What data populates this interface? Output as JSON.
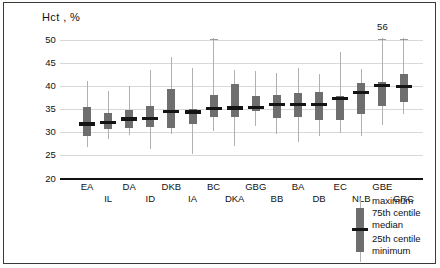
{
  "chart_data": {
    "type": "box",
    "title": "Hct , %",
    "xlabel": "",
    "ylabel": "Hct , %",
    "ylim": [
      20,
      50
    ],
    "yticks": [
      20,
      25,
      30,
      35,
      40,
      45,
      50
    ],
    "grid": true,
    "legend_position": "bottom-right",
    "categories": [
      "EA",
      "IL",
      "DA",
      "ID",
      "DKB",
      "IA",
      "BC",
      "DKA",
      "GBG",
      "BB",
      "BA",
      "DB",
      "EC",
      "NLB",
      "GBE",
      "GRC"
    ],
    "annotations": [
      {
        "text": "56",
        "category": "GBE",
        "value": 56,
        "note": "maximum exceeds axis range, value labelled above clipped whisker"
      }
    ],
    "stat_keys": [
      "minimum",
      "25th centile",
      "median",
      "75th centile",
      "maximum"
    ],
    "boxes": [
      {
        "label": "EA",
        "minimum": 26.8,
        "q1": 29.3,
        "median": 31.8,
        "q3": 35.6,
        "maximum": 41.2
      },
      {
        "label": "IL",
        "minimum": 28.6,
        "q1": 30.8,
        "median": 32.1,
        "q3": 34.3,
        "maximum": 38.9
      },
      {
        "label": "DA",
        "minimum": 29.4,
        "q1": 31.0,
        "median": 32.9,
        "q3": 34.8,
        "maximum": 40.0
      },
      {
        "label": "ID",
        "minimum": 26.4,
        "q1": 31.1,
        "median": 33.0,
        "q3": 35.8,
        "maximum": 43.5
      },
      {
        "label": "DKB",
        "minimum": 29.7,
        "q1": 30.9,
        "median": 34.5,
        "q3": 39.4,
        "maximum": 46.4
      },
      {
        "label": "IA",
        "minimum": 25.4,
        "q1": 31.7,
        "median": 34.4,
        "q3": 35.0,
        "maximum": 44.0
      },
      {
        "label": "BC",
        "minimum": 30.2,
        "q1": 33.3,
        "median": 35.2,
        "q3": 38.1,
        "maximum": 50.1
      },
      {
        "label": "DKA",
        "minimum": 27.1,
        "q1": 33.3,
        "median": 35.3,
        "q3": 40.4,
        "maximum": 43.5
      },
      {
        "label": "GBG",
        "minimum": 31.3,
        "q1": 34.6,
        "median": 35.4,
        "q3": 37.9,
        "maximum": 43.4
      },
      {
        "label": "BB",
        "minimum": 29.7,
        "q1": 33.1,
        "median": 36.1,
        "q3": 38.0,
        "maximum": 42.8
      },
      {
        "label": "BA",
        "minimum": 28.0,
        "q1": 33.4,
        "median": 36.0,
        "q3": 38.5,
        "maximum": 43.9
      },
      {
        "label": "DB",
        "minimum": 29.2,
        "q1": 32.6,
        "median": 36.1,
        "q3": 38.7,
        "maximum": 42.7
      },
      {
        "label": "EC",
        "minimum": 29.8,
        "q1": 32.6,
        "median": 37.3,
        "q3": 37.8,
        "maximum": 47.5
      },
      {
        "label": "NLB",
        "minimum": 29.2,
        "q1": 34.0,
        "median": 38.7,
        "q3": 40.7,
        "maximum": 43.7
      },
      {
        "label": "GBE",
        "minimum": 31.6,
        "q1": 35.6,
        "median": 40.1,
        "q3": 41.0,
        "maximum": 56.0
      },
      {
        "label": "GRC",
        "minimum": 33.9,
        "q1": 36.6,
        "median": 40.0,
        "q3": 42.6,
        "maximum": 50.1
      }
    ]
  },
  "legend": {
    "items": [
      {
        "label": "maximum"
      },
      {
        "label": "75th centile"
      },
      {
        "label": "median"
      },
      {
        "label": "25th centile"
      },
      {
        "label": "minimum"
      }
    ]
  },
  "colors": {
    "box_fill": "#6e6e6e",
    "median_line": "#141414",
    "whisker": "#b0b0b0",
    "gridline": "#d8d8d8",
    "axis": "#111111",
    "background": "#ffffff",
    "page_border": "#3a3a3a"
  }
}
